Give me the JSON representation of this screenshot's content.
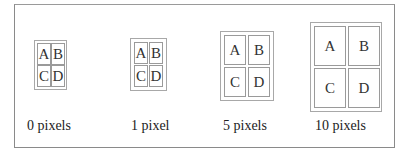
{
  "figure": {
    "examples": [
      {
        "label": "0 pixels",
        "spacing": 0,
        "cells": [
          "A",
          "B",
          "C",
          "D"
        ]
      },
      {
        "label": "1 pixel",
        "spacing": 1,
        "cells": [
          "A",
          "B",
          "C",
          "D"
        ]
      },
      {
        "label": "5 pixels",
        "spacing": 5,
        "cells": [
          "A",
          "B",
          "C",
          "D"
        ]
      },
      {
        "label": "10 pixels",
        "spacing": 10,
        "cells": [
          "A",
          "B",
          "C",
          "D"
        ]
      }
    ]
  },
  "colors": {
    "frame_border": "#8a8a8a",
    "table_border": "#a8a8a8",
    "cell_border": "#9a9a9a",
    "background": "#ffffff"
  }
}
